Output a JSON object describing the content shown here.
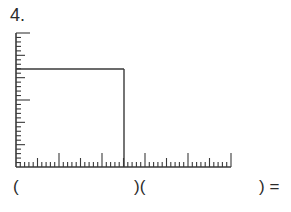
{
  "problem": {
    "number_label": "4."
  },
  "equation": {
    "open_paren": "(",
    "middle_parens": ")(",
    "close_equals": ") ="
  },
  "figure": {
    "stroke_color": "#3a3a3a",
    "origin": {
      "x": 16,
      "y": 167
    },
    "vertical_ruler": {
      "top_y": 33,
      "minor_ticks": 30,
      "medium_every": 5,
      "long_ticks_at": [
        0,
        15,
        30
      ],
      "minor_len": 5,
      "medium_len": 9,
      "long_len": 14
    },
    "horizontal_ruler": {
      "right_x": 231,
      "minor_ticks": 50,
      "medium_every": 5,
      "long_every": 10,
      "minor_len": 5,
      "medium_len": 9,
      "long_len": 14
    },
    "rectangle": {
      "top_y": 69,
      "right_x": 124
    }
  }
}
